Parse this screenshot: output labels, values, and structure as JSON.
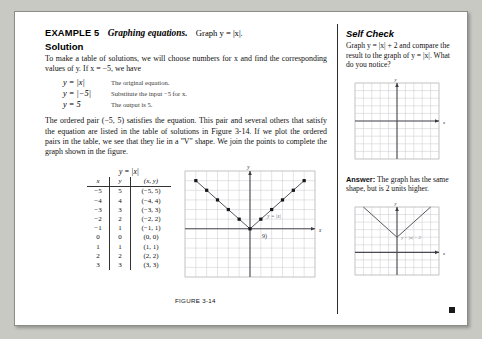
{
  "example": {
    "label": "EXAMPLE 5",
    "title": "Graphing equations.",
    "instruction": "Graph y = |x|."
  },
  "solution": {
    "heading": "Solution",
    "intro": "To make a table of solutions, we will choose numbers for x and find the corresponding values of y. If x = −5, we have",
    "steps": [
      {
        "equation": "y = |x|",
        "note": "The original equation."
      },
      {
        "equation": "y = |−5|",
        "note": "Substitute the input −5 for x."
      },
      {
        "equation": "y = 5",
        "note": "The output is 5."
      }
    ],
    "paragraph": "The ordered pair (−5, 5) satisfies the equation. This pair and several others that satisfy the equation are listed in the table of solutions in Figure 3-14. If we plot the ordered pairs in the table, we see that they lie in a \"V\" shape. We join the points to complete the graph shown in the figure."
  },
  "table": {
    "caption": "y = |x|",
    "headers": [
      "x",
      "y",
      "(x, y)"
    ],
    "rows": [
      [
        "−5",
        "5",
        "(−5, 5)"
      ],
      [
        "−4",
        "4",
        "(−4, 4)"
      ],
      [
        "−3",
        "3",
        "(−3, 3)"
      ],
      [
        "−2",
        "2",
        "(−2, 2)"
      ],
      [
        "−1",
        "1",
        "(−1, 1)"
      ],
      [
        "0",
        "0",
        "(0, 0)"
      ],
      [
        "1",
        "1",
        "(1, 1)"
      ],
      [
        "2",
        "2",
        "(2, 2)"
      ],
      [
        "3",
        "3",
        "(3, 3)"
      ]
    ]
  },
  "figure": {
    "caption": "FIGURE 3-14",
    "stray_text": "9)"
  },
  "self_check": {
    "heading": "Self Check",
    "prompt": "Graph y = |x| + 2 and compare the result to the graph of y = |x|. What do you notice?",
    "answer_label": "Answer:",
    "answer_text": "The graph has the same shape, but is 2 units higher."
  },
  "chart_data": [
    {
      "type": "line",
      "name": "main-figure-graph",
      "title": "",
      "function": "y = |x|",
      "curve_label": "y = |x|",
      "xlabel": "x",
      "ylabel": "y",
      "xlim": [
        -6,
        6
      ],
      "ylim": [
        -5,
        6
      ],
      "grid": true,
      "x": [
        -5,
        -4,
        -3,
        -2,
        -1,
        0,
        1,
        2,
        3,
        4,
        5
      ],
      "values": [
        5,
        4,
        3,
        2,
        1,
        0,
        1,
        2,
        3,
        4,
        5
      ],
      "markers": [
        [
          -5,
          5
        ],
        [
          -4,
          4
        ],
        [
          -3,
          3
        ],
        [
          -2,
          2
        ],
        [
          -1,
          1
        ],
        [
          0,
          0
        ],
        [
          1,
          1
        ],
        [
          2,
          2
        ],
        [
          3,
          3
        ],
        [
          4,
          4
        ],
        [
          5,
          5
        ]
      ],
      "legend": "none"
    },
    {
      "type": "line",
      "name": "self-check-blank-grid",
      "title": "",
      "function": "",
      "curve_label": "",
      "xlabel": "x",
      "ylabel": "y",
      "xlim": [
        -5,
        5
      ],
      "ylim": [
        -5,
        5
      ],
      "grid": true,
      "x": [],
      "values": [],
      "markers": [],
      "legend": "none"
    },
    {
      "type": "line",
      "name": "answer-graph",
      "title": "",
      "function": "y = |x| + 2",
      "curve_label": "y = |x| + 2",
      "xlabel": "x",
      "ylabel": "y",
      "xlim": [
        -5,
        5
      ],
      "ylim": [
        -3,
        6
      ],
      "grid": true,
      "x": [
        -4,
        -3,
        -2,
        -1,
        0,
        1,
        2,
        3,
        4
      ],
      "values": [
        6,
        5,
        4,
        3,
        2,
        3,
        4,
        5,
        6
      ],
      "markers": [],
      "legend": "none"
    }
  ]
}
